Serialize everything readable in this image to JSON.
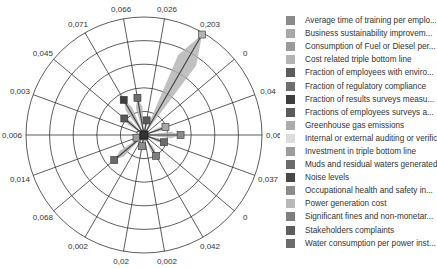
{
  "chart_data": {
    "type": "radar",
    "title": "",
    "center": [
      144,
      135
    ],
    "radius": 118,
    "rings": 5,
    "spoke_count": 18,
    "value_max": 0.203,
    "categories": [
      "Average time of training per emplo...",
      "Business sustainability improvem...",
      "Consumption of Fuel or Diesel per...",
      "Cost related triple bottom line",
      "Fraction of employees with enviro...",
      "Fraction of regulatory compliance",
      "Fraction of results surveys measu...",
      "Fractions of employees surveys a...",
      "Greenhouse gas emissions",
      "Internal or external auditing or verific",
      "Investment in triple bottom line",
      "Muds and residual waters generated",
      "Noise levels",
      "Occupational health and safety in...",
      "Power generation cost",
      "Significant fines and non-monetar...",
      "Stakeholders complaints",
      "Water consumption per power inst..."
    ],
    "spoke_labels": [
      "0,064",
      "0,04",
      "0",
      "0,203",
      "0,026",
      "0,066",
      "0,071",
      "0,045",
      "0,003",
      "0,006",
      "0,014",
      "0,068",
      "0,002",
      "0,02",
      "0,002",
      "0,042",
      "0",
      "0,037"
    ],
    "values": [
      0.064,
      0.04,
      0,
      0.203,
      0.026,
      0.066,
      0.071,
      0.045,
      0.003,
      0.006,
      0.014,
      0.068,
      0.002,
      0.02,
      0.002,
      0.042,
      0,
      0.037
    ],
    "colors": [
      "#8a8a8a",
      "#a8a8a8",
      "#9a9a9a",
      "#b4b4b4",
      "#5c5c5c",
      "#6e6e6e",
      "#3e3e3e",
      "#5a5a5a",
      "#ababab",
      "#dcdcdc",
      "#9c9c9c",
      "#6a6a6a",
      "#484848",
      "#8c8c8c",
      "#b8b8b8",
      "#7e7e7e",
      "#5e5e5e",
      "#6c6c6c"
    ],
    "legend_position": "right",
    "grid": true
  },
  "legend": {
    "items": [
      {
        "label": "Average time of training per emplo...",
        "color": "#8a8a8a"
      },
      {
        "label": "Business sustainability improvem...",
        "color": "#a8a8a8"
      },
      {
        "label": "Consumption of Fuel or Diesel per...",
        "color": "#9a9a9a"
      },
      {
        "label": "Cost related triple bottom line",
        "color": "#b4b4b4"
      },
      {
        "label": "Fraction of employees with enviro...",
        "color": "#5c5c5c"
      },
      {
        "label": "Fraction of regulatory compliance",
        "color": "#6e6e6e"
      },
      {
        "label": "Fraction of results surveys measu...",
        "color": "#3e3e3e"
      },
      {
        "label": "Fractions of employees surveys a...",
        "color": "#5a5a5a"
      },
      {
        "label": "Greenhouse gas emissions",
        "color": "#ababab"
      },
      {
        "label": "Internal or external auditing or verific",
        "color": "#dcdcdc"
      },
      {
        "label": "Investment in triple bottom line",
        "color": "#9c9c9c"
      },
      {
        "label": "Muds and residual waters generated",
        "color": "#6a6a6a"
      },
      {
        "label": "Noise levels",
        "color": "#484848"
      },
      {
        "label": "Occupational health and safety in...",
        "color": "#8c8c8c"
      },
      {
        "label": "Power generation cost",
        "color": "#b8b8b8"
      },
      {
        "label": "Significant fines and non-monetar...",
        "color": "#7e7e7e"
      },
      {
        "label": "Stakeholders complaints",
        "color": "#5e5e5e"
      },
      {
        "label": "Water consumption per power inst...",
        "color": "#6c6c6c"
      }
    ]
  }
}
